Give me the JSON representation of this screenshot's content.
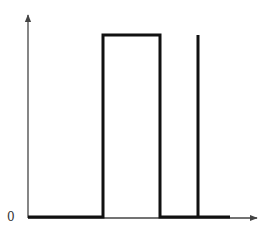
{
  "diagram": {
    "type": "signal-waveform",
    "origin_label": "0",
    "colors": {
      "axis": "#444444",
      "signal": "#111111",
      "background": "#ffffff"
    },
    "axes": {
      "x_axis": {
        "x1": 28,
        "y": 218,
        "x2": 257,
        "arrow": true
      },
      "y_axis": {
        "x": 28,
        "y1": 218,
        "y2": 15,
        "arrow": true
      }
    },
    "signal_path_points": [
      [
        28,
        217
      ],
      [
        103,
        217
      ],
      [
        103,
        35
      ],
      [
        160,
        35
      ],
      [
        160,
        217
      ],
      [
        198,
        217
      ],
      [
        198,
        35
      ],
      [
        198,
        217
      ],
      [
        230,
        217
      ]
    ],
    "segments": [
      {
        "name": "low-start",
        "from_x": 28,
        "to_x": 103,
        "level": "low"
      },
      {
        "name": "rectangular-pulse",
        "from_x": 103,
        "to_x": 160,
        "level": "high"
      },
      {
        "name": "low-middle",
        "from_x": 160,
        "to_x": 198,
        "level": "low"
      },
      {
        "name": "impulse-spike",
        "at_x": 198,
        "level": "high"
      },
      {
        "name": "low-end",
        "from_x": 198,
        "to_x": 230,
        "level": "low"
      }
    ]
  }
}
